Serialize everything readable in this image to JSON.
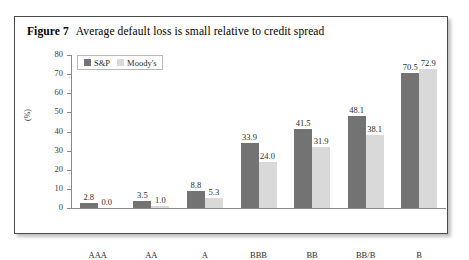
{
  "figure": {
    "number_label": "Figure 7",
    "caption": "Average default loss is small relative to credit spread"
  },
  "chart_data": {
    "type": "bar",
    "title": "Average default loss is small relative to credit spread",
    "xlabel": "",
    "ylabel": "(%)",
    "ylim": [
      0,
      80
    ],
    "yticks": [
      "0",
      "10",
      "20",
      "30",
      "40",
      "50",
      "60",
      "70",
      "80"
    ],
    "grid": false,
    "legend_position": "top-left",
    "categories": [
      "AAA",
      "AA",
      "A",
      "BBB",
      "BB",
      "BB/B",
      "B"
    ],
    "series": [
      {
        "name": "S&P",
        "color": "#737373",
        "values": [
          2.8,
          3.5,
          8.8,
          33.9,
          41.5,
          48.1,
          70.5
        ],
        "labels": [
          "2.8",
          "3.5",
          "8.8",
          "33.9",
          "41.5",
          "48.1",
          "70.5"
        ]
      },
      {
        "name": "Moody's",
        "color": "#d9d9d9",
        "values": [
          0.0,
          1.0,
          5.3,
          24.0,
          31.9,
          38.1,
          72.9
        ],
        "labels": [
          "0.0",
          "1.0",
          "5.3",
          "24.0",
          "31.9",
          "38.1",
          "72.9"
        ]
      }
    ]
  },
  "colors": {
    "sp_bar": "#737373",
    "moodys_bar": "#d9d9d9",
    "axis": "#8a8a8a",
    "frame": "#4a4a4a",
    "text": "#2b2b2b"
  }
}
